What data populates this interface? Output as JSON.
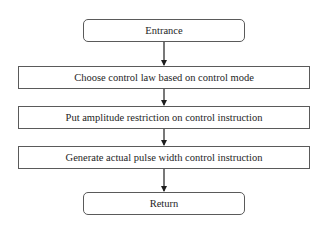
{
  "diagram": {
    "type": "flowchart",
    "nodes": [
      {
        "id": "entrance",
        "shape": "rounded-rect",
        "label": "Entrance"
      },
      {
        "id": "step1",
        "shape": "rect",
        "label": "Choose control law based on control mode"
      },
      {
        "id": "step2",
        "shape": "rect",
        "label": "Put amplitude restriction on control instruction"
      },
      {
        "id": "step3",
        "shape": "rect",
        "label": "Generate actual pulse width control instruction"
      },
      {
        "id": "return",
        "shape": "rounded-rect",
        "label": "Return"
      }
    ],
    "edges": [
      {
        "from": "entrance",
        "to": "step1"
      },
      {
        "from": "step1",
        "to": "step2"
      },
      {
        "from": "step2",
        "to": "step3"
      },
      {
        "from": "step3",
        "to": "return"
      }
    ],
    "colors": {
      "stroke": "#5a5a5a",
      "arrow": "#1e1e1e",
      "text": "#1e1e1e",
      "background": "#ffffff"
    }
  }
}
